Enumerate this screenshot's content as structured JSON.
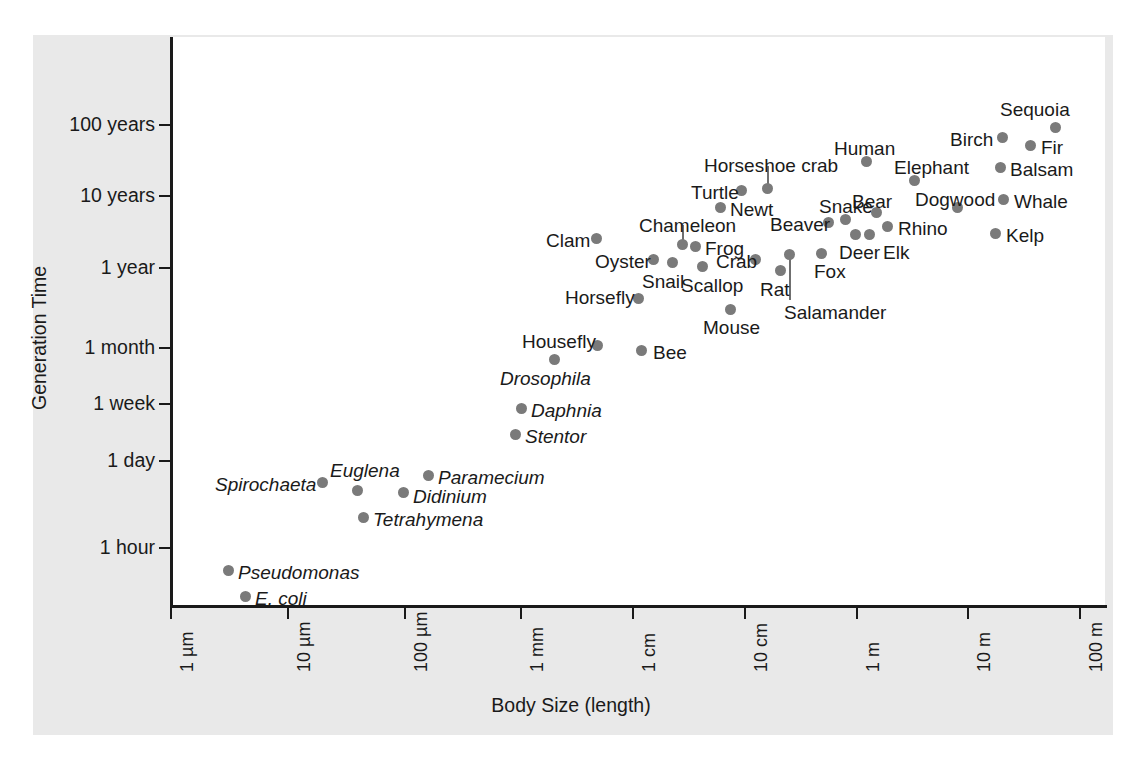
{
  "figure": {
    "background_color": "#e9e9e9",
    "plot_background_color": "#ffffff",
    "point_color": "#7a7a7a",
    "axis_color": "#1a1a1a"
  },
  "axes": {
    "y_title": "Generation Time",
    "x_title": "Body Size (length)",
    "y_ticks": [
      {
        "label": "100 years",
        "y": 125
      },
      {
        "label": "10 years",
        "y": 196
      },
      {
        "label": "1 year",
        "y": 268
      },
      {
        "label": "1 month",
        "y": 348
      },
      {
        "label": "1 week",
        "y": 404
      },
      {
        "label": "1 day",
        "y": 461
      },
      {
        "label": "1 hour",
        "y": 548
      }
    ],
    "x_ticks": [
      {
        "label": "1 µm",
        "x": 171
      },
      {
        "label": "10 µm",
        "x": 288
      },
      {
        "label": "100 µm",
        "x": 405
      },
      {
        "label": "1 mm",
        "x": 521
      },
      {
        "label": "1 cm",
        "x": 633
      },
      {
        "label": "10 cm",
        "x": 745
      },
      {
        "label": "1 m",
        "x": 857
      },
      {
        "label": "10 m",
        "x": 968
      },
      {
        "label": "100 m",
        "x": 1080
      }
    ]
  },
  "chart_data": {
    "type": "scatter",
    "title": "",
    "xlabel": "Body Size (length)",
    "ylabel": "Generation Time",
    "xscale": "log",
    "yscale": "log",
    "xlim": [
      "1 µm",
      "100 m"
    ],
    "ylim": [
      "< 1 hour",
      "> 100 years"
    ],
    "xtick_labels": [
      "1 µm",
      "10 µm",
      "100 µm",
      "1 mm",
      "1 cm",
      "10 cm",
      "1 m",
      "10 m",
      "100 m"
    ],
    "ytick_labels": [
      "1 hour",
      "1 day",
      "1 week",
      "1 month",
      "1 year",
      "10 years",
      "100 years"
    ],
    "grid": false,
    "legend": "none",
    "points": [
      {
        "name": "E. coli",
        "italic": true,
        "px": 245,
        "py": 596,
        "lx": 255,
        "ly": 589,
        "body_size": "2 µm",
        "generation_time": "~20 minutes"
      },
      {
        "name": "Pseudomonas",
        "italic": true,
        "px": 228,
        "py": 570,
        "lx": 238,
        "ly": 563,
        "body_size": "1.5 µm",
        "generation_time": "~40 minutes"
      },
      {
        "name": "Tetrahymena",
        "italic": true,
        "px": 363,
        "py": 517,
        "lx": 373,
        "ly": 510,
        "body_size": "50 µm",
        "generation_time": "~3 hours"
      },
      {
        "name": "Spirochaeta",
        "italic": true,
        "px": 322,
        "py": 482,
        "lx": 215,
        "ly": 475,
        "body_size": "20 µm",
        "generation_time": "~10 hours"
      },
      {
        "name": "Didinium",
        "italic": true,
        "px": 403,
        "py": 492,
        "lx": 413,
        "ly": 487,
        "body_size": "120 µm",
        "generation_time": "~8 hours"
      },
      {
        "name": "Euglena",
        "italic": true,
        "px": 357,
        "py": 490,
        "lx": 330,
        "ly": 461,
        "body_size": "50 µm",
        "generation_time": "~9 hours"
      },
      {
        "name": "Paramecium",
        "italic": true,
        "px": 428,
        "py": 475,
        "lx": 438,
        "ly": 468,
        "body_size": "200 µm",
        "generation_time": "~12 hours"
      },
      {
        "name": "Stentor",
        "italic": true,
        "px": 515,
        "py": 434,
        "lx": 525,
        "ly": 427,
        "body_size": "1 mm",
        "generation_time": "~1.5 days"
      },
      {
        "name": "Daphnia",
        "italic": true,
        "px": 521,
        "py": 408,
        "lx": 531,
        "ly": 401,
        "body_size": "1.2 mm",
        "generation_time": "~1 week"
      },
      {
        "name": "Drosophila",
        "italic": true,
        "px": 554,
        "py": 359,
        "lx": 500,
        "ly": 369,
        "body_size": "2.5 mm",
        "generation_time": "~2.5 weeks"
      },
      {
        "name": "Housefly",
        "italic": false,
        "px": 597,
        "py": 345,
        "lx": 522,
        "ly": 332,
        "body_size": "6 mm",
        "generation_time": "~1 month"
      },
      {
        "name": "Bee",
        "italic": false,
        "px": 641,
        "py": 350,
        "lx": 653,
        "ly": 343,
        "body_size": "12 mm",
        "generation_time": "~1 month"
      },
      {
        "name": "Horsefly",
        "italic": false,
        "px": 638,
        "py": 298,
        "lx": 565,
        "ly": 288,
        "body_size": "13 mm",
        "generation_time": "~6 months"
      },
      {
        "name": "Mouse",
        "italic": false,
        "px": 730,
        "py": 309,
        "lx": 703,
        "ly": 318,
        "body_size": "8 cm",
        "generation_time": "~4 months"
      },
      {
        "name": "Clam",
        "italic": false,
        "px": 596,
        "py": 238,
        "lx": 546,
        "ly": 231,
        "body_size": "7 mm",
        "generation_time": "~2 years"
      },
      {
        "name": "Oyster",
        "italic": false,
        "px": 653,
        "py": 259,
        "lx": 595,
        "ly": 252,
        "body_size": "2 cm",
        "generation_time": "~1 year"
      },
      {
        "name": "Snail",
        "italic": false,
        "px": 672,
        "py": 262,
        "lx": 642,
        "ly": 272,
        "body_size": "3 cm",
        "generation_time": "~1 year"
      },
      {
        "name": "Scallop",
        "italic": false,
        "px": 702,
        "py": 266,
        "lx": 681,
        "ly": 276,
        "body_size": "5 cm",
        "generation_time": "~1 year"
      },
      {
        "name": "Chameleon",
        "italic": false,
        "px": 682,
        "py": 244,
        "lx": 639,
        "ly": 216,
        "body_size": "4 cm",
        "generation_time": "~2 years"
      },
      {
        "name": "Frog",
        "italic": false,
        "px": 695,
        "py": 246,
        "lx": 705,
        "ly": 239,
        "body_size": "5 cm",
        "generation_time": "~2 years"
      },
      {
        "name": "Crab",
        "italic": false,
        "px": 755,
        "py": 259,
        "lx": 716,
        "ly": 252,
        "body_size": "10 cm",
        "generation_time": "~1 year"
      },
      {
        "name": "Newt",
        "italic": false,
        "px": 720,
        "py": 207,
        "lx": 730,
        "ly": 200,
        "body_size": "8 cm",
        "generation_time": "~5 years"
      },
      {
        "name": "Turtle",
        "italic": false,
        "px": 741,
        "py": 190,
        "lx": 691,
        "ly": 183,
        "body_size": "20 cm",
        "generation_time": "~8 years"
      },
      {
        "name": "Horseshoe crab",
        "italic": false,
        "px": 767,
        "py": 188,
        "lx": 704,
        "ly": 156,
        "body_size": "30 cm",
        "generation_time": "~10 years"
      },
      {
        "name": "Rat",
        "italic": false,
        "px": 780,
        "py": 270,
        "lx": 760,
        "ly": 280,
        "body_size": "20 cm",
        "generation_time": "~1 year"
      },
      {
        "name": "Salamander",
        "italic": false,
        "px": 789,
        "py": 254,
        "lx": 784,
        "ly": 303,
        "body_size": "25 cm",
        "generation_time": "~1 year"
      },
      {
        "name": "Fox",
        "italic": false,
        "px": 821,
        "py": 253,
        "lx": 814,
        "ly": 262,
        "body_size": "60 cm",
        "generation_time": "~1.5 years"
      },
      {
        "name": "Beaver",
        "italic": false,
        "px": 828,
        "py": 222,
        "lx": 770,
        "ly": 215,
        "body_size": "70 cm",
        "generation_time": "~3 years"
      },
      {
        "name": "Snake",
        "italic": false,
        "px": 845,
        "py": 219,
        "lx": 819,
        "ly": 197,
        "body_size": "1 m",
        "generation_time": "~3 years"
      },
      {
        "name": "Deer",
        "italic": false,
        "px": 855,
        "py": 234,
        "lx": 839,
        "ly": 243,
        "body_size": "1.5 m",
        "generation_time": "~2 years"
      },
      {
        "name": "Elk",
        "italic": false,
        "px": 869,
        "py": 234,
        "lx": 883,
        "ly": 243,
        "body_size": "2 m",
        "generation_time": "~2 years"
      },
      {
        "name": "Bear",
        "italic": false,
        "px": 876,
        "py": 212,
        "lx": 852,
        "ly": 192,
        "body_size": "2 m",
        "generation_time": "~4 years"
      },
      {
        "name": "Rhino",
        "italic": false,
        "px": 887,
        "py": 226,
        "lx": 898,
        "ly": 219,
        "body_size": "3 m",
        "generation_time": "~3 years"
      },
      {
        "name": "Human",
        "italic": false,
        "px": 866,
        "py": 161,
        "lx": 834,
        "ly": 139,
        "body_size": "1.7 m",
        "generation_time": "~25 years"
      },
      {
        "name": "Elephant",
        "italic": false,
        "px": 914,
        "py": 180,
        "lx": 894,
        "ly": 158,
        "body_size": "4 m",
        "generation_time": "~15 years"
      },
      {
        "name": "Dogwood",
        "italic": false,
        "px": 957,
        "py": 207,
        "lx": 915,
        "ly": 190,
        "body_size": "8 m",
        "generation_time": "~6 years"
      },
      {
        "name": "Whale",
        "italic": false,
        "px": 1003,
        "py": 199,
        "lx": 1014,
        "ly": 192,
        "body_size": "20 m",
        "generation_time": "~8 years"
      },
      {
        "name": "Kelp",
        "italic": false,
        "px": 995,
        "py": 233,
        "lx": 1006,
        "ly": 226,
        "body_size": "20 m",
        "generation_time": "~2 years"
      },
      {
        "name": "Balsam",
        "italic": false,
        "px": 1000,
        "py": 167,
        "lx": 1010,
        "ly": 160,
        "body_size": "20 m",
        "generation_time": "~20 years"
      },
      {
        "name": "Birch",
        "italic": false,
        "px": 1002,
        "py": 137,
        "lx": 950,
        "ly": 130,
        "body_size": "20 m",
        "generation_time": "~40 years"
      },
      {
        "name": "Fir",
        "italic": false,
        "px": 1030,
        "py": 145,
        "lx": 1041,
        "ly": 138,
        "body_size": "40 m",
        "generation_time": "~35 years"
      },
      {
        "name": "Sequoia",
        "italic": false,
        "px": 1055,
        "py": 127,
        "lx": 1000,
        "ly": 100,
        "body_size": "70 m",
        "generation_time": "~60 years"
      }
    ],
    "leaders": [
      {
        "name": "Chameleon",
        "x": 682,
        "y1": 225,
        "y2": 244
      },
      {
        "name": "Horseshoe crab",
        "x": 767,
        "y1": 166,
        "y2": 188
      },
      {
        "name": "Salamander",
        "x": 789,
        "y1": 254,
        "y2": 300
      }
    ]
  }
}
